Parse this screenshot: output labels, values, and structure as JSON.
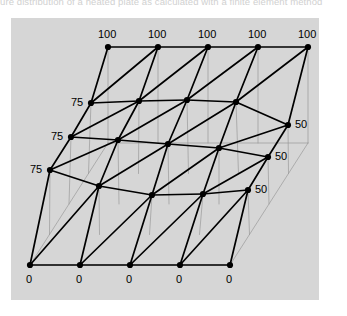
{
  "caption": {
    "text": "ure distribution of a heated plate as calculated with a finite element method"
  },
  "panel": {
    "background": "#d6d6d6",
    "x": 11,
    "y": 18,
    "width": 308,
    "height": 282
  },
  "style": {
    "mesh_line_color": "#000000",
    "guide_line_color": "#9a9a9a",
    "node_color": "#000000",
    "label_color": "#000000",
    "mesh_line_width": 1.7,
    "guide_line_width": 0.7,
    "node_radius": 3.1
  },
  "chart_data": {
    "type": "mesh-surface",
    "title": "",
    "grid": {
      "rows": 5,
      "cols": 5
    },
    "quantity": "temperature",
    "boundary_conditions": {
      "top_edge": 100,
      "bottom_edge": 0,
      "left_edge": 75,
      "right_edge": 50
    },
    "node_values": [
      [
        100,
        100,
        100,
        100,
        100
      ],
      [
        75,
        0,
        0,
        0,
        50
      ],
      [
        75,
        0,
        0,
        0,
        50
      ],
      [
        75,
        0,
        0,
        0,
        50
      ],
      [
        0,
        0,
        0,
        0,
        0
      ]
    ],
    "labels": {
      "top": [
        "100",
        "100",
        "100",
        "100",
        "100"
      ],
      "bottom": [
        "0",
        "0",
        "0",
        "0",
        "0"
      ],
      "left": [
        "75",
        "75",
        "75"
      ],
      "right": [
        "50",
        "50",
        "50"
      ]
    },
    "node_positions": [
      [
        [
          108,
          47
        ],
        [
          158,
          47
        ],
        [
          208,
          47
        ],
        [
          258,
          47
        ],
        [
          308,
          47
        ]
      ],
      [
        [
          91,
          103
        ],
        [
          139,
          101
        ],
        [
          187,
          100
        ],
        [
          236,
          102
        ],
        [
          288,
          125
        ]
      ],
      [
        [
          71,
          137
        ],
        [
          118,
          140
        ],
        [
          168,
          144
        ],
        [
          219,
          148
        ],
        [
          268,
          157
        ]
      ],
      [
        [
          50,
          170
        ],
        [
          99,
          186
        ],
        [
          152,
          195
        ],
        [
          203,
          194
        ],
        [
          248,
          190
        ]
      ],
      [
        [
          30,
          265
        ],
        [
          80,
          265
        ],
        [
          130,
          265
        ],
        [
          180,
          265
        ],
        [
          230,
          265
        ]
      ]
    ],
    "projection_base_corners": [
      [
        30,
        265
      ],
      [
        230,
        265
      ],
      [
        308,
        143
      ],
      [
        108,
        143
      ]
    ]
  },
  "labels_top": [
    {
      "text": "100",
      "x": 98,
      "y": 29
    },
    {
      "text": "100",
      "x": 148,
      "y": 29
    },
    {
      "text": "100",
      "x": 198,
      "y": 29
    },
    {
      "text": "100",
      "x": 248,
      "y": 29
    },
    {
      "text": "100",
      "x": 298,
      "y": 29
    }
  ],
  "labels_bottom": [
    {
      "text": "0",
      "x": 26,
      "y": 274
    },
    {
      "text": "0",
      "x": 76,
      "y": 274
    },
    {
      "text": "0",
      "x": 126,
      "y": 274
    },
    {
      "text": "0",
      "x": 176,
      "y": 274
    },
    {
      "text": "0",
      "x": 226,
      "y": 274
    }
  ],
  "labels_left": [
    {
      "text": "75",
      "x": 71,
      "y": 97
    },
    {
      "text": "75",
      "x": 51,
      "y": 131
    },
    {
      "text": "75",
      "x": 30,
      "y": 164
    }
  ],
  "labels_right": [
    {
      "text": "50",
      "x": 295,
      "y": 119
    },
    {
      "text": "50",
      "x": 275,
      "y": 151
    },
    {
      "text": "50",
      "x": 255,
      "y": 184
    }
  ]
}
